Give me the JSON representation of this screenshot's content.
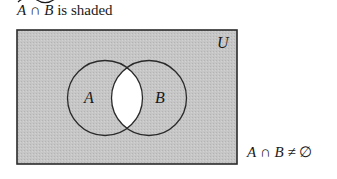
{
  "caption": {
    "expression_left": "A",
    "operator": "∩",
    "expression_right": "B",
    "complement_mark": "~",
    "suffix": "is shaded"
  },
  "diagram": {
    "universe_label": "U",
    "set_a_label": "A",
    "set_b_label": "B",
    "shaded_region": "complement of A ∩ B",
    "colors": {
      "shade": "#c4c4c4",
      "unshaded": "#ffffff",
      "stroke": "#2a2a2a"
    }
  },
  "note": {
    "left": "A",
    "operator": "∩",
    "right": "B",
    "relation": "≠",
    "empty_set": "∅"
  }
}
